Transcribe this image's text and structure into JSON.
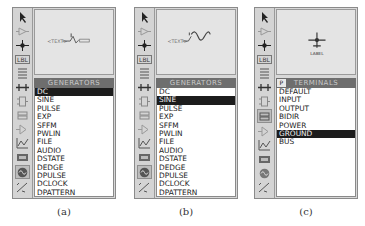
{
  "panels": [
    {
      "caption": "(a)",
      "header": "GENERATORS",
      "preview_text": "<TEXT>",
      "preview_symbol": "dc-generator",
      "items": [
        "DC",
        "SINE",
        "PULSE",
        "EXP",
        "SFFM",
        "PWLIN",
        "FILE",
        "AUDIO",
        "DSTATE",
        "DEDGE",
        "DPULSE",
        "DCLOCK",
        "DPATTERN"
      ],
      "selected": "DC"
    },
    {
      "caption": "(b)",
      "header": "GENERATORS",
      "preview_text": "<TEXT>",
      "preview_symbol": "sine-generator",
      "items": [
        "DC",
        "SINE",
        "PULSE",
        "EXP",
        "SFFM",
        "PWLIN",
        "FILE",
        "AUDIO",
        "DSTATE",
        "DEDGE",
        "DPULSE",
        "DCLOCK",
        "DPATTERN"
      ],
      "selected": "SINE"
    },
    {
      "caption": "(c)",
      "header": "TERMINALS",
      "header_button": "P",
      "preview_text": "LABEL",
      "preview_symbol": "ground-terminal",
      "items": [
        "DEFAULT",
        "INPUT",
        "OUTPUT",
        "BIDIR",
        "POWER",
        "GROUND",
        "BUS"
      ],
      "selected": "GROUND"
    }
  ],
  "toolbar": [
    "selection-mode",
    "component-mode",
    "junction-dot",
    "wire-label",
    "text-script",
    "buses",
    "subcircuit",
    "terminals",
    "device-pins",
    "graph",
    "tape-recorder",
    "generator",
    "voltage-probe"
  ],
  "toolbar_label_lbl": "LBL"
}
